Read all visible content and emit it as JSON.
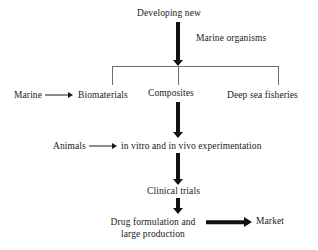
{
  "diagram": {
    "accent_color": "#111111",
    "line_color": "#6f6f6f",
    "nodes": {
      "developing_new": "Developing new",
      "marine_organisms": "Marine organisms",
      "marine": "Marine",
      "biomaterials": "Biomaterials",
      "composites": "Composites",
      "deep_sea_fisheries": "Deep sea fisheries",
      "animals": "Animals",
      "experimentation": "in vitro and in vivo experimentation",
      "clinical_trials": "Clinical trials",
      "drug_formulation": "Drug formulation and large production",
      "drug_formulation_line1": "Drug formulation and",
      "drug_formulation_line2": "large production",
      "market": "Market"
    },
    "connectors": [
      {
        "name": "developing-new-to-bracket",
        "type": "thick-vertical-arrow"
      },
      {
        "name": "marine-to-biomaterials",
        "type": "thin-horizontal-arrow"
      },
      {
        "name": "bracket-split",
        "type": "bracket"
      },
      {
        "name": "composites-to-animals-row",
        "type": "thick-vertical-arrow"
      },
      {
        "name": "animals-to-experimentation",
        "type": "thin-horizontal-arrow"
      },
      {
        "name": "experimentation-to-clinical-trials",
        "type": "thick-vertical-arrow"
      },
      {
        "name": "clinical-trials-to-drug-formulation",
        "type": "thick-vertical-arrow"
      },
      {
        "name": "drug-formulation-to-market",
        "type": "thick-horizontal-arrow"
      }
    ]
  }
}
